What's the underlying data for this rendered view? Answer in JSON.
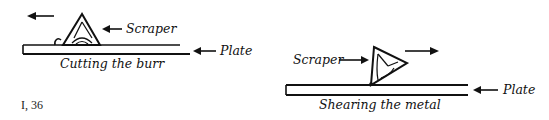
{
  "figure_left": {
    "caption": "Cutting the burr",
    "scraper_label": "Scraper",
    "plate_label": "Plate",
    "motion": "left"
  },
  "figure_right": {
    "caption": "Shearing the metal",
    "scraper_label": "Scraper",
    "plate_label": "Plate",
    "motion": "right"
  },
  "reference": "I, 36"
}
